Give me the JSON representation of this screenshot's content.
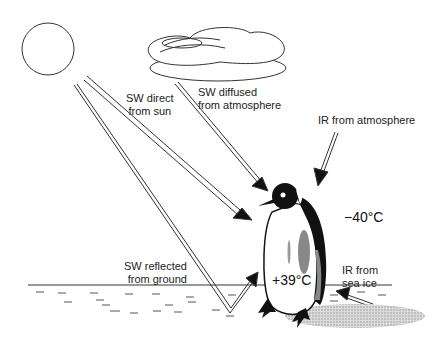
{
  "labels": {
    "sw_direct_line1": "SW direct",
    "sw_direct_line2": "from sun",
    "sw_diffused_line1": "SW diffused",
    "sw_diffused_line2": "from atmosphere",
    "ir_atmosphere": "IR from atmosphere",
    "sw_reflected_line1": "SW reflected",
    "sw_reflected_line2": "from ground",
    "ir_sea_ice_line1": "IR from",
    "ir_sea_ice_line2": "sea ice",
    "air_temp": "−40°C",
    "body_temp": "+39°C"
  },
  "colors": {
    "line": "#333333",
    "penguin_black": "#111111",
    "shade_gray": "#999999",
    "shadow": "#bbbbbb"
  }
}
